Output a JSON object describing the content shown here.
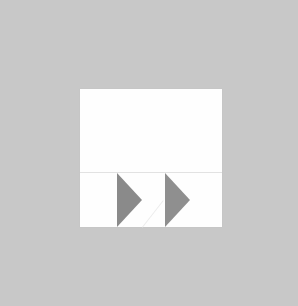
{
  "scene": {
    "description": "White square paper on gray background with two gray right-pointing triangles in the lower section",
    "background_color": "#c8c8c8",
    "paper_color": "#fefefe",
    "shapes": [
      {
        "type": "triangle",
        "direction": "right",
        "color": "#8a8a8a"
      },
      {
        "type": "triangle",
        "direction": "right",
        "color": "#8f8f8f"
      }
    ]
  }
}
